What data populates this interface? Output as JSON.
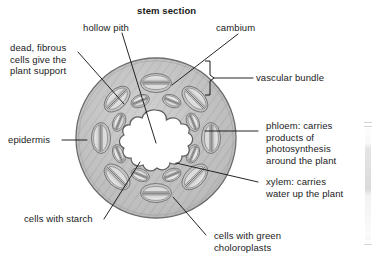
{
  "figure": {
    "title": "stem section",
    "colors": {
      "cortex_fill": "#b9b9b9",
      "cortex_stroke": "#6e6e6e",
      "pith_fill": "#ffffff",
      "bundle_fill": "#d2d2d2",
      "bundle_stroke": "#7a7a7a",
      "inner_cell_fill": "#e2e2e2",
      "leader_line": "#1a1a1a",
      "text": "#1a1a1a",
      "background": "#ffffff"
    }
  },
  "labels": {
    "title": "stem section",
    "hollow_pith": "hollow pith",
    "cambium": "cambium",
    "dead_fibrous": "dead, fibrous\ncells give the\nplant support",
    "vascular_bundle": "vascular bundle",
    "epidermis": "epidermis",
    "phloem": "phloem: carries\nproducts of\nphotosynthesis\naround the plant",
    "xylem": "xylem: carries\nwater up the plant",
    "cells_with_starch": "cells with starch",
    "cells_with_chloroplasts": "cells with green\ncholoroplasts"
  },
  "structures": {
    "cortex": "cortex-ring",
    "pith": "hollow-pith-lobed-cavity",
    "outer_bundles_count": 8,
    "inner_bundles_count": 8,
    "bracket": "vascular-bundle-bracket"
  }
}
